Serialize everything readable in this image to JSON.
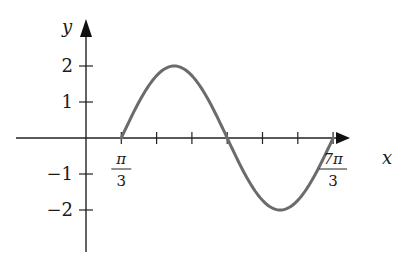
{
  "chart_data": {
    "type": "line",
    "title": "",
    "function": "y = 2 sin(x - π/3)",
    "xlabel": "x",
    "ylabel": "y",
    "x_range": [
      "π/3",
      "7π/3"
    ],
    "xlim_units_of_pi_over_3": [
      -2,
      8
    ],
    "ylim": [
      -3.2,
      3.2
    ],
    "grid": false,
    "legend": null,
    "x_ticks_pi_over_3": [
      1,
      2,
      3,
      4,
      5,
      6,
      7
    ],
    "x_tick_labels": [
      {
        "at": 1,
        "num": "π",
        "den": "3"
      },
      {
        "at": 7,
        "num": "7π",
        "den": "3"
      }
    ],
    "y_ticks": [
      2,
      1,
      -1,
      -2
    ],
    "y_tick_labels": [
      "2",
      "1",
      "−1",
      "−2"
    ],
    "series": [
      {
        "name": "curve",
        "x": [
          "π/3",
          "5π/6",
          "4π/3",
          "11π/6",
          "7π/3"
        ],
        "values": [
          0,
          2,
          0,
          -2,
          0
        ]
      }
    ],
    "color": "#6b6b6b"
  },
  "axes": {
    "x_label": "x",
    "y_label": "y"
  }
}
